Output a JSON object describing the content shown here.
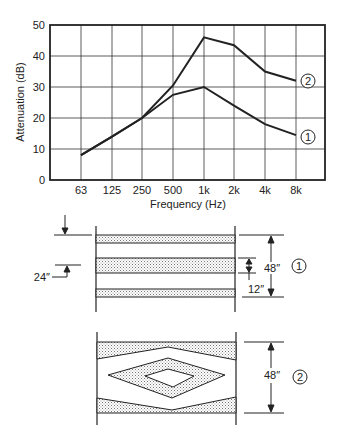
{
  "chart_data": {
    "type": "line",
    "title": "",
    "xlabel": "Frequency (Hz)",
    "ylabel": "Attenuation (dB)",
    "categories": [
      "63",
      "125",
      "250",
      "500",
      "1k",
      "2k",
      "4k",
      "8k"
    ],
    "y_ticks": [
      "0",
      "10",
      "20",
      "30",
      "40",
      "50"
    ],
    "ylim": [
      0,
      50
    ],
    "grid": true,
    "legend": "inline circled labels at line ends",
    "series": [
      {
        "name": "1",
        "values": [
          8,
          14,
          20,
          27.5,
          30,
          24,
          18,
          14.5
        ]
      },
      {
        "name": "2",
        "values": [
          8,
          14,
          20,
          30.5,
          46,
          43.5,
          35,
          32
        ]
      }
    ]
  },
  "diagrams": [
    {
      "id": "1",
      "description": "Parallel baffles (three horizontal absorptive panels)",
      "labels": {
        "spacing": "24″",
        "panel_thickness": "12″",
        "height": "48″",
        "marker": "1"
      }
    },
    {
      "id": "2",
      "description": "Diamond-shaped baffles with angled top/bottom liners",
      "labels": {
        "height": "48″",
        "marker": "2"
      }
    }
  ]
}
